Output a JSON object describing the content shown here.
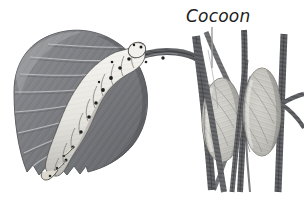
{
  "figure": {
    "type": "scientific-illustration",
    "style": "grayscale pen-and-ink stipple engraving",
    "background_color": "#ffffff",
    "width": 304,
    "height": 200
  },
  "labels": [
    {
      "id": "cocoon",
      "text": "Cocoon",
      "color": "#1c1c1c",
      "x": 186,
      "y": 22,
      "italic": true,
      "font_size": 17
    }
  ],
  "leader_lines": [
    {
      "id": "cocoon-leader",
      "from_x": 212,
      "from_y": 27,
      "to_x": 212,
      "to_y": 68,
      "color": "#9a9a9a",
      "width": 1.4
    }
  ],
  "panels": [
    {
      "id": "left-panel",
      "name": "caterpillar-on-leaf",
      "x": 8,
      "y": 28,
      "width": 150,
      "height": 160
    },
    {
      "id": "right-panel",
      "name": "cocoons-on-twigs",
      "x": 190,
      "y": 30,
      "width": 106,
      "height": 160
    }
  ],
  "elements": {
    "leaf": {
      "name": "leaf",
      "fill": "#7f8083",
      "shade_dark": "#53555a",
      "shade_light": "#a9abaf",
      "vein_color": "#cfd1d4",
      "margin": "serrated",
      "vein_count": 9
    },
    "caterpillar": {
      "name": "caterpillar",
      "body_fill": "#eceae4",
      "body_shade": "#b4b2ac",
      "outline": "#4a4a4a",
      "spot_color": "#1f1f1f",
      "segment_count": 11,
      "spot_count": 12,
      "posture": "arched, gripping twig"
    },
    "twig": {
      "name": "twig",
      "fill": "#4e4f52",
      "highlight": "#8d8f93"
    },
    "cocoons": [
      {
        "name": "cocoon-left",
        "cx": 222,
        "cy": 120,
        "rx": 20,
        "ry": 42,
        "fill": "#cfcec9",
        "fiber_color": "#8e8d88"
      },
      {
        "name": "cocoon-right",
        "cx": 262,
        "cy": 112,
        "rx": 19,
        "ry": 44,
        "fill": "#cfcec9",
        "fiber_color": "#8e8d88"
      }
    ],
    "branches": {
      "name": "branches",
      "fill": "#5b5c5f",
      "count": 5
    }
  }
}
